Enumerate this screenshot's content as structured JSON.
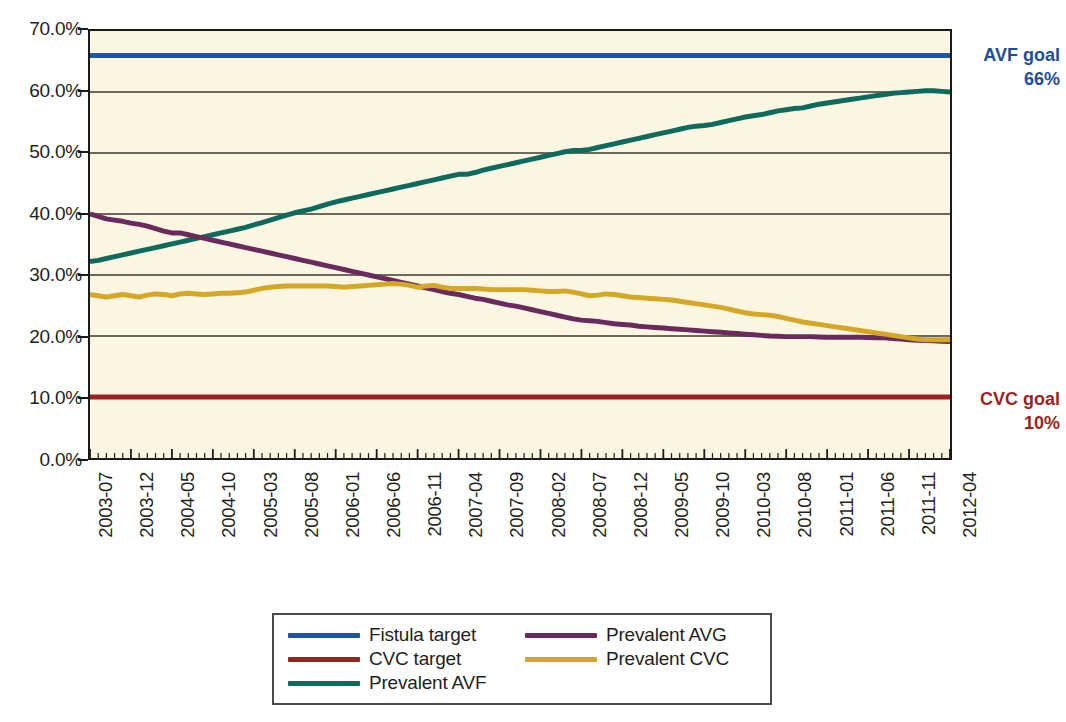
{
  "chart_data": {
    "type": "line",
    "title": "",
    "xlabel": "",
    "ylabel": "",
    "ylim": [
      0,
      70
    ],
    "ytick_labels": [
      "0.0%",
      "10.0%",
      "20.0%",
      "30.0%",
      "40.0%",
      "50.0%",
      "60.0%",
      "70.0%"
    ],
    "ytick_values": [
      0,
      10,
      20,
      30,
      40,
      50,
      60,
      70
    ],
    "grid": true,
    "legend_position": "bottom",
    "x_tick_labels": [
      "2003-07",
      "2003-12",
      "2004-05",
      "2004-10",
      "2005-03",
      "2005-08",
      "2006-01",
      "2006-06",
      "2006-11",
      "2007-04",
      "2007-09",
      "2008-02",
      "2008-07",
      "2008-12",
      "2009-05",
      "2009-10",
      "2010-03",
      "2010-08",
      "2011-01",
      "2011-06",
      "2011-11",
      "2012-04"
    ],
    "x_start": "2003-07",
    "x_end": "2012-04",
    "x_interval": "monthly",
    "n_points": 106,
    "series": [
      {
        "name": "Fistula target",
        "color": "#2255a0",
        "constant": 66.0,
        "values": [
          66,
          66,
          66,
          66,
          66,
          66,
          66,
          66,
          66,
          66,
          66,
          66,
          66,
          66,
          66,
          66,
          66,
          66,
          66,
          66,
          66,
          66,
          66,
          66,
          66,
          66,
          66,
          66,
          66,
          66,
          66,
          66,
          66,
          66,
          66,
          66,
          66,
          66,
          66,
          66,
          66,
          66,
          66,
          66,
          66,
          66,
          66,
          66,
          66,
          66,
          66,
          66,
          66,
          66,
          66,
          66,
          66,
          66,
          66,
          66,
          66,
          66,
          66,
          66,
          66,
          66,
          66,
          66,
          66,
          66,
          66,
          66,
          66,
          66,
          66,
          66,
          66,
          66,
          66,
          66,
          66,
          66,
          66,
          66,
          66,
          66,
          66,
          66,
          66,
          66,
          66,
          66,
          66,
          66,
          66,
          66,
          66,
          66,
          66,
          66,
          66,
          66,
          66,
          66,
          66,
          66
        ]
      },
      {
        "name": "CVC target",
        "color": "#9e2020",
        "constant": 10.0,
        "values": [
          10,
          10,
          10,
          10,
          10,
          10,
          10,
          10,
          10,
          10,
          10,
          10,
          10,
          10,
          10,
          10,
          10,
          10,
          10,
          10,
          10,
          10,
          10,
          10,
          10,
          10,
          10,
          10,
          10,
          10,
          10,
          10,
          10,
          10,
          10,
          10,
          10,
          10,
          10,
          10,
          10,
          10,
          10,
          10,
          10,
          10,
          10,
          10,
          10,
          10,
          10,
          10,
          10,
          10,
          10,
          10,
          10,
          10,
          10,
          10,
          10,
          10,
          10,
          10,
          10,
          10,
          10,
          10,
          10,
          10,
          10,
          10,
          10,
          10,
          10,
          10,
          10,
          10,
          10,
          10,
          10,
          10,
          10,
          10,
          10,
          10,
          10,
          10,
          10,
          10,
          10,
          10,
          10,
          10,
          10,
          10,
          10,
          10,
          10,
          10,
          10,
          10,
          10,
          10,
          10,
          10
        ]
      },
      {
        "name": "Prevalent AVF",
        "color": "#0e6a5c",
        "values": [
          32.2,
          32.4,
          32.7,
          33.0,
          33.3,
          33.6,
          33.9,
          34.2,
          34.5,
          34.8,
          35.1,
          35.4,
          35.7,
          36.0,
          36.3,
          36.6,
          36.9,
          37.2,
          37.5,
          37.8,
          38.2,
          38.6,
          39.0,
          39.4,
          39.8,
          40.2,
          40.5,
          40.8,
          41.2,
          41.6,
          42.0,
          42.3,
          42.6,
          42.9,
          43.2,
          43.5,
          43.8,
          44.1,
          44.4,
          44.7,
          45.0,
          45.3,
          45.6,
          45.9,
          46.2,
          46.5,
          46.5,
          46.8,
          47.2,
          47.5,
          47.8,
          48.1,
          48.4,
          48.7,
          49.0,
          49.3,
          49.6,
          49.9,
          50.2,
          50.4,
          50.4,
          50.6,
          50.9,
          51.2,
          51.5,
          51.8,
          52.1,
          52.4,
          52.7,
          53.0,
          53.3,
          53.6,
          53.9,
          54.2,
          54.4,
          54.5,
          54.7,
          55.0,
          55.3,
          55.6,
          55.9,
          56.1,
          56.3,
          56.6,
          56.9,
          57.1,
          57.3,
          57.4,
          57.7,
          58.0,
          58.2,
          58.4,
          58.6,
          58.8,
          59.0,
          59.2,
          59.4,
          59.6,
          59.8,
          59.9,
          60.0,
          60.1,
          60.2,
          60.2,
          60.1,
          60.0
        ]
      },
      {
        "name": "Prevalent AVG",
        "color": "#6b2a5e",
        "values": [
          40.0,
          39.6,
          39.2,
          39.0,
          38.8,
          38.5,
          38.3,
          38.0,
          37.6,
          37.2,
          36.9,
          36.9,
          36.6,
          36.3,
          36.0,
          35.7,
          35.4,
          35.1,
          34.8,
          34.5,
          34.2,
          33.9,
          33.6,
          33.3,
          33.0,
          32.7,
          32.4,
          32.1,
          31.8,
          31.5,
          31.2,
          30.9,
          30.6,
          30.3,
          30.0,
          29.7,
          29.4,
          29.1,
          28.8,
          28.5,
          28.2,
          27.9,
          27.6,
          27.3,
          27.0,
          26.8,
          26.5,
          26.2,
          26.0,
          25.7,
          25.4,
          25.1,
          24.9,
          24.6,
          24.3,
          24.0,
          23.7,
          23.4,
          23.1,
          22.8,
          22.6,
          22.5,
          22.4,
          22.2,
          22.0,
          21.9,
          21.8,
          21.6,
          21.5,
          21.4,
          21.3,
          21.2,
          21.1,
          21.0,
          20.9,
          20.8,
          20.7,
          20.6,
          20.5,
          20.4,
          20.3,
          20.2,
          20.1,
          20.0,
          19.95,
          19.9,
          19.9,
          19.9,
          19.9,
          19.85,
          19.8,
          19.8,
          19.8,
          19.8,
          19.8,
          19.75,
          19.7,
          19.7,
          19.6,
          19.5,
          19.4,
          19.3,
          19.25,
          19.2,
          19.15,
          19.1
        ]
      },
      {
        "name": "Prevalent CVC",
        "color": "#d4a726",
        "values": [
          26.8,
          26.6,
          26.4,
          26.6,
          26.8,
          26.6,
          26.4,
          26.7,
          26.9,
          26.8,
          26.6,
          26.9,
          27.0,
          26.9,
          26.8,
          26.9,
          27.0,
          27.0,
          27.1,
          27.2,
          27.5,
          27.8,
          28.0,
          28.1,
          28.2,
          28.2,
          28.2,
          28.2,
          28.2,
          28.2,
          28.1,
          28.0,
          28.1,
          28.2,
          28.3,
          28.4,
          28.5,
          28.6,
          28.5,
          28.3,
          28.0,
          28.2,
          28.3,
          28.0,
          27.8,
          27.8,
          27.8,
          27.8,
          27.7,
          27.6,
          27.6,
          27.6,
          27.6,
          27.6,
          27.5,
          27.4,
          27.3,
          27.3,
          27.4,
          27.2,
          26.9,
          26.6,
          26.7,
          26.9,
          26.8,
          26.6,
          26.4,
          26.3,
          26.2,
          26.1,
          26.0,
          25.9,
          25.7,
          25.5,
          25.3,
          25.1,
          24.9,
          24.7,
          24.4,
          24.1,
          23.8,
          23.6,
          23.5,
          23.4,
          23.2,
          22.9,
          22.6,
          22.3,
          22.1,
          21.9,
          21.7,
          21.5,
          21.3,
          21.1,
          20.9,
          20.7,
          20.5,
          20.3,
          20.1,
          19.9,
          19.7,
          19.5,
          19.4,
          19.4,
          19.4,
          19.4
        ]
      }
    ],
    "annotations": [
      {
        "id": "avf-goal",
        "line1": "AVF goal",
        "line2": "66%",
        "color": "#1f4e9c",
        "y_value": 66
      },
      {
        "id": "cvc-goal",
        "line1": "CVC goal",
        "line2": "10%",
        "color": "#9d1f1f",
        "y_value": 10
      }
    ]
  },
  "legend": {
    "items": [
      {
        "label": "Fistula target",
        "color": "#2255a0"
      },
      {
        "label": "CVC target",
        "color": "#9e2020"
      },
      {
        "label": "Prevalent AVF",
        "color": "#0e6a5c"
      },
      {
        "label": "Prevalent AVG",
        "color": "#6b2a5e"
      },
      {
        "label": "Prevalent CVC",
        "color": "#d4a726"
      }
    ]
  },
  "colors": {
    "plot_background": "#fbf6e2",
    "axis": "#1a1a1a",
    "gridline": "#3a3a32",
    "page_background": "#ffffff"
  }
}
